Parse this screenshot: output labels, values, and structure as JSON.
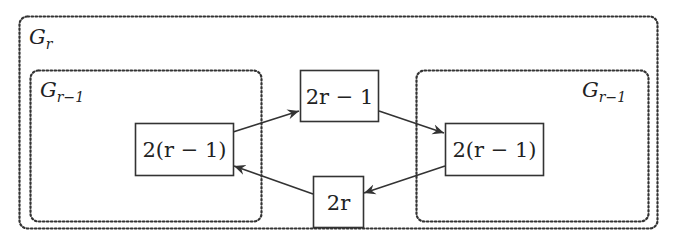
{
  "diagram": {
    "outer_group": {
      "label_main": "G",
      "label_sub": "r"
    },
    "left_group": {
      "label_main": "G",
      "label_sub": "r−1"
    },
    "right_group": {
      "label_main": "G",
      "label_sub": "r−1"
    },
    "nodes": {
      "top_center": "2r − 1",
      "left": "2(r − 1)",
      "right": "2(r − 1)",
      "bottom_center": "2r"
    },
    "edges": [
      {
        "from": "left",
        "to": "top_center"
      },
      {
        "from": "top_center",
        "to": "right"
      },
      {
        "from": "right",
        "to": "bottom_center"
      },
      {
        "from": "bottom_center",
        "to": "left"
      }
    ],
    "colors": {
      "stroke": "#333333",
      "dotted": "#333333",
      "background": "#ffffff"
    }
  }
}
